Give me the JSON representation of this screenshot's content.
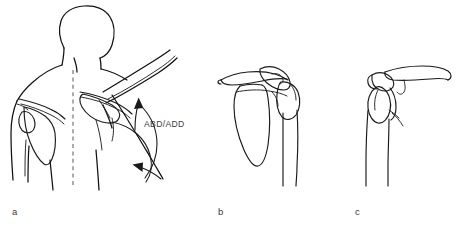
{
  "figure": {
    "background_color": "#ffffff",
    "line_color": "#1a1a1a",
    "label_color": "#3a3a3a",
    "midline_color": "#6f6f6f",
    "width": 469,
    "height": 231
  },
  "panels": [
    {
      "id": "a",
      "label": "a",
      "label_x": 12,
      "label_y": 215,
      "caption": "Posterior view of head, neck, trunk and shoulders with right arm abducted",
      "annotations": [
        {
          "name": "motion-label",
          "text": "ABD/ADD",
          "x": 144,
          "y": 127
        }
      ],
      "elements": [
        "head-outline",
        "neck-outline",
        "left-shoulder-outline",
        "right-shoulder-outline",
        "left-scapula",
        "right-scapula",
        "spine-of-scapula",
        "vertebral-midline-dashed",
        "abducted-arm",
        "trunk-outline",
        "range-of-motion-arc",
        "abduction-arrow-up",
        "adduction-arrow-down"
      ]
    },
    {
      "id": "b",
      "label": "b",
      "label_x": 218,
      "label_y": 215,
      "caption": "Anterior view of shoulder girdle: clavicle, scapula and humerus in neutral position",
      "annotations": [],
      "elements": [
        "clavicle",
        "acromion",
        "coracoid-process",
        "scapula-body",
        "glenoid",
        "humeral-head",
        "humerus-shaft"
      ]
    },
    {
      "id": "c",
      "label": "c",
      "label_x": 355,
      "label_y": 215,
      "caption": "Lateral view of shoulder girdle: clavicle, acromion and humerus",
      "annotations": [],
      "elements": [
        "clavicle",
        "acromion",
        "coracoid-process",
        "humeral-head",
        "humerus-shaft",
        "glenoid-marker"
      ]
    }
  ]
}
